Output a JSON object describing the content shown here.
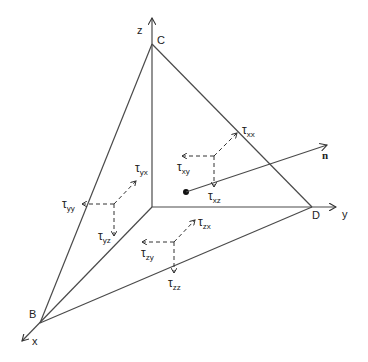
{
  "diagram": {
    "colors": {
      "line": "#4a4a4a",
      "text": "#222222",
      "background": "#ffffff"
    },
    "axes": {
      "x": {
        "label": "x"
      },
      "y": {
        "label": "y"
      },
      "z": {
        "label": "z"
      }
    },
    "vertices": {
      "B": "B",
      "C": "C",
      "D": "D"
    },
    "normal": {
      "label": "n"
    },
    "stresses": {
      "xx": {
        "tau": "τ",
        "sub": "xx"
      },
      "xy": {
        "tau": "τ",
        "sub": "xy"
      },
      "xz": {
        "tau": "τ",
        "sub": "xz"
      },
      "yx": {
        "tau": "τ",
        "sub": "yx"
      },
      "yy": {
        "tau": "τ",
        "sub": "yy"
      },
      "yz": {
        "tau": "τ",
        "sub": "yz"
      },
      "zx": {
        "tau": "τ",
        "sub": "zx"
      },
      "zy": {
        "tau": "τ",
        "sub": "zy"
      },
      "zz": {
        "tau": "τ",
        "sub": "zz"
      }
    }
  }
}
